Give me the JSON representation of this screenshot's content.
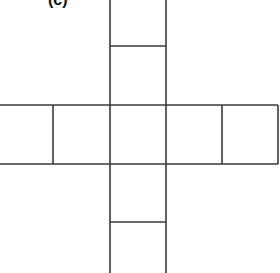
{
  "figure": {
    "label": "(c)",
    "line_color": "#3a3a3a",
    "background": "#ffffff",
    "horizontal_row_cells": 5,
    "vertical_column_cells_above": 2,
    "vertical_column_cells_below": 2
  }
}
